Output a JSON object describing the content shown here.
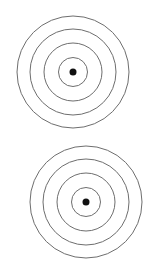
{
  "diagram": {
    "ring_color": "#6e6e6e",
    "dot_color": "#111111",
    "background": "#ffffff",
    "targets": [
      {
        "name": "top-target",
        "cx": 73,
        "cy": 72,
        "ring_radii": [
          56,
          43,
          29,
          14.5
        ],
        "dot_radius": 3.5
      },
      {
        "name": "bottom-target",
        "cx": 86,
        "cy": 202,
        "ring_radii": [
          56,
          43,
          29,
          14.5
        ],
        "dot_radius": 3.5
      }
    ]
  }
}
